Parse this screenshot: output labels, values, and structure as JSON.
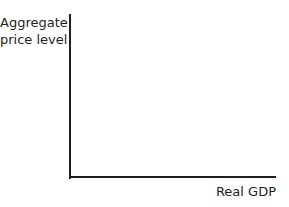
{
  "diagram": {
    "type": "axes",
    "y_axis": {
      "label_line1": "Aggregate",
      "label_line2": "price level"
    },
    "x_axis": {
      "label": "Real GDP"
    },
    "colors": {
      "axis": "#231f20",
      "background": "#ffffff"
    }
  }
}
